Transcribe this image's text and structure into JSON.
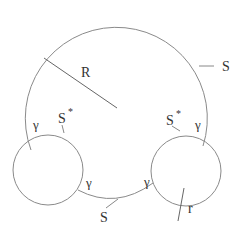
{
  "diagram": {
    "labels": {
      "R": "R",
      "S_top": "S",
      "S_bottom": "S",
      "S_star_left": "S",
      "S_star_right": "S",
      "star": "*",
      "gamma_left_top": "γ",
      "gamma_right_top": "γ",
      "gamma_left_bottom": "γ",
      "gamma_right_bottom": "γ",
      "r": "r"
    },
    "colors": {
      "stroke": "#8a8a8a",
      "text": "#333333",
      "background": "#ffffff"
    }
  }
}
